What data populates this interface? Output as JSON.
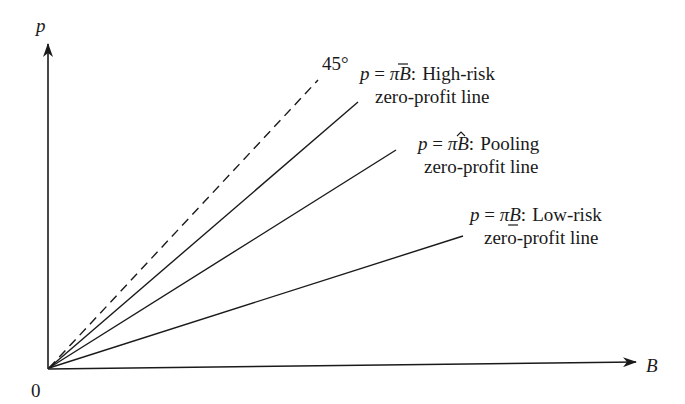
{
  "diagram": {
    "type": "economics-zero-profit-lines",
    "axes": {
      "y_label": "p",
      "x_label": "B",
      "origin_label": "0"
    },
    "reference_line": {
      "label": "45°",
      "style": "dashed"
    },
    "lines": [
      {
        "id": "high-risk",
        "eq_var": "p",
        "eq_sign": " = ",
        "eq_coef": "π",
        "eq_coef_mark": "overbar",
        "eq_rhs": "B",
        "eq_colon": ":",
        "name": "High-risk",
        "subtitle": "zero-profit line"
      },
      {
        "id": "pooling",
        "eq_var": "p",
        "eq_sign": " = ",
        "eq_coef": "π",
        "eq_coef_mark": "hat",
        "eq_rhs": "B",
        "eq_colon": ":",
        "name": "Pooling",
        "subtitle": "zero-profit line"
      },
      {
        "id": "low-risk",
        "eq_var": "p",
        "eq_sign": " = ",
        "eq_coef": "π",
        "eq_coef_mark": "underbar",
        "eq_rhs": "B",
        "eq_colon": ":",
        "name": "Low-risk",
        "subtitle": "zero-profit line"
      }
    ],
    "colors": {
      "ink": "#1a1a1a",
      "background": "#ffffff"
    }
  }
}
